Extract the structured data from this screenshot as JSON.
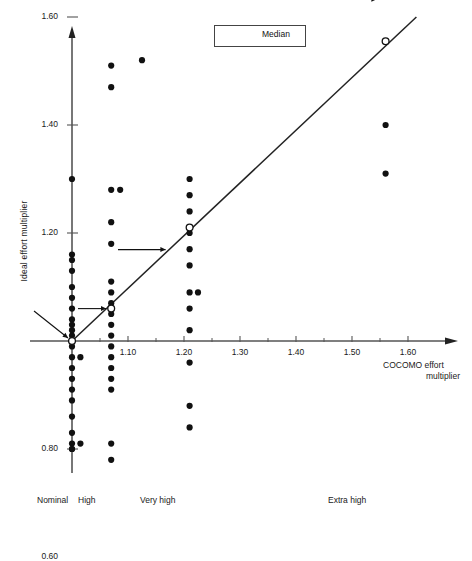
{
  "chart_data": {
    "type": "scatter",
    "title": "",
    "xlabel": "COCOMO effort multiplier",
    "ylabel": "Ideal effort multiplier",
    "xlim": [
      0.955,
      1.66
    ],
    "ylim": [
      0.5,
      2.45
    ],
    "grid": false,
    "legend": {
      "position": "top-right",
      "entries": [
        "Median"
      ]
    },
    "xtick_labels": [
      "1.10",
      "1.20",
      "1.30",
      "1.40",
      "1.50",
      "1.60"
    ],
    "xtick_values": [
      1.1,
      1.2,
      1.3,
      1.4,
      1.5,
      1.6
    ],
    "xminor_values": [
      1.05,
      1.15,
      1.25,
      1.35,
      1.45,
      1.55
    ],
    "ytick_labels": [
      "0.60",
      "0.80",
      "1.20",
      "1.40",
      "1.60",
      "1.80",
      "2.00"
    ],
    "ytick_values": [
      0.6,
      0.8,
      1.2,
      1.4,
      1.6,
      1.8,
      2.0
    ],
    "category_labels": [
      "Nominal",
      "High",
      "Very high",
      "Extra high"
    ],
    "category_x": [
      1.0,
      1.07,
      1.21,
      1.56
    ],
    "annotations": [
      {
        "text": "2.40",
        "x": 1.0,
        "y": 2.4
      },
      {
        "text": "2.34",
        "x": 1.56,
        "y": 2.34
      }
    ],
    "series": [
      {
        "name": "Nominal",
        "x": 1.0,
        "values": [
          2.4,
          1.67,
          1.3,
          1.16,
          1.15,
          1.13,
          1.1,
          1.08,
          1.06,
          1.04,
          1.03,
          1.02,
          1.01,
          1.0,
          1.0,
          0.99,
          0.97,
          0.95,
          0.93,
          0.91,
          0.89,
          0.86,
          0.83,
          0.81,
          0.8,
          0.8,
          0.6
        ]
      },
      {
        "name": "Nominal-offset",
        "x": 1.015,
        "values": [
          0.97,
          0.81
        ]
      },
      {
        "name": "High",
        "x": 1.07,
        "values": [
          1.51,
          1.47,
          1.28,
          1.22,
          1.18,
          1.11,
          1.09,
          1.07,
          1.05,
          1.03,
          1.01,
          0.99,
          0.97,
          0.95,
          0.93,
          0.91,
          0.81,
          0.78
        ]
      },
      {
        "name": "High-offset",
        "x": 1.086,
        "values": [
          1.28
        ]
      },
      {
        "name": "High-far",
        "x": 1.125,
        "values": [
          1.52
        ]
      },
      {
        "name": "Very high",
        "x": 1.21,
        "values": [
          2.35,
          1.73,
          1.3,
          1.27,
          1.24,
          1.2,
          1.17,
          1.14,
          1.09,
          1.06,
          1.02,
          0.96,
          0.88,
          0.84,
          0.62
        ]
      },
      {
        "name": "Very high-offset",
        "x": 1.225,
        "values": [
          1.09
        ]
      },
      {
        "name": "Extra high",
        "x": 1.56,
        "values": [
          2.34,
          1.92,
          1.87,
          1.76,
          1.72,
          1.68,
          1.4,
          1.31
        ]
      }
    ],
    "medians": [
      {
        "category": "Nominal",
        "x": 1.0,
        "y": 1.0
      },
      {
        "category": "High",
        "x": 1.07,
        "y": 1.06
      },
      {
        "category": "Very high",
        "x": 1.21,
        "y": 1.21
      },
      {
        "category": "Extra high",
        "x": 1.56,
        "y": 1.555
      }
    ],
    "median_line": {
      "x0": 1.0,
      "y0": 1.0,
      "x1": 1.615,
      "y1": 1.6
    },
    "median_arrows": [
      {
        "target_x": 1.0,
        "target_y": 1.0
      },
      {
        "target_x": 1.07,
        "target_y": 1.06
      },
      {
        "target_x": 1.21,
        "target_y": 1.21
      },
      {
        "target_x": 1.56,
        "target_y": 1.555
      }
    ]
  },
  "axis": {
    "ylabel": "Ideal effort multiplier",
    "xlabel_line1": "COCOMO effort",
    "xlabel_line2": "multiplier"
  },
  "legend": {
    "label": "Median"
  },
  "colors": {
    "point": "#111111",
    "axis": "#555555",
    "line": "#222222",
    "text": "#1a1a1a",
    "background": "#ffffff"
  }
}
